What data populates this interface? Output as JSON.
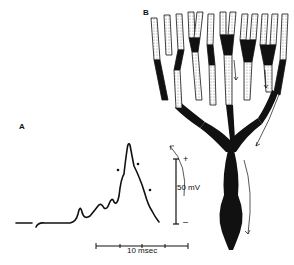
{
  "figure": {
    "panels": [
      {
        "id": "A",
        "label": "A",
        "content": "action potential trace with dendritic spikes"
      },
      {
        "id": "B",
        "label": "B",
        "content": "Purkinje cell dendritic tree with propagation arrows"
      }
    ],
    "voltage_scale": {
      "label": "50 mV",
      "plus": "+",
      "minus": "–"
    },
    "time_scale": {
      "label": "10 msec"
    },
    "colors": {
      "ink": "#111111",
      "background": "#ffffff",
      "stipple": "#cccccc"
    }
  }
}
